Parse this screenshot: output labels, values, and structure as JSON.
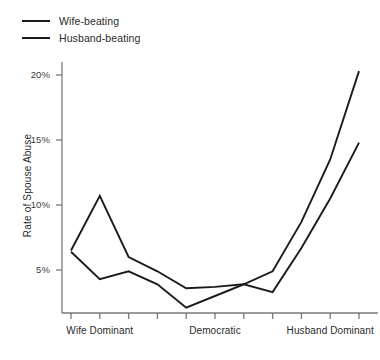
{
  "chart_data": {
    "type": "line",
    "title": "",
    "subtitle": "",
    "xlabel": "",
    "ylabel": "Rate of Spouse Abuse",
    "legend_position": "top-left",
    "grid": false,
    "x_axis": {
      "tick_count": 11,
      "labeled_ticks": [
        {
          "index": 1,
          "label": "Wife Dominant"
        },
        {
          "index": 5,
          "label": "Democratic"
        },
        {
          "index": 9,
          "label": "Husband Dominant"
        }
      ],
      "categories": [
        "",
        "Wife Dominant",
        "",
        "",
        "",
        "Democratic",
        "",
        "",
        "",
        "Husband Dominant",
        ""
      ]
    },
    "y_axis": {
      "ticks": [
        5,
        10,
        15,
        20
      ],
      "tick_labels": [
        "5%",
        "10%",
        "15%",
        "20%"
      ],
      "ylim": [
        0.3,
        21.0
      ],
      "unit": "%"
    },
    "series": [
      {
        "name": "Wife-beating",
        "color": "#1b1b1b",
        "values": [
          6.5,
          10.7,
          6.0,
          4.9,
          3.6,
          3.7,
          3.9,
          4.9,
          8.7,
          13.5,
          20.3
        ]
      },
      {
        "name": "Husband-beating",
        "color": "#1b1b1b",
        "values": [
          6.4,
          4.3,
          4.9,
          3.9,
          2.1,
          3.0,
          3.9,
          3.3,
          6.7,
          10.5,
          14.8
        ]
      }
    ]
  },
  "legend": {
    "items": [
      {
        "label": "Wife-beating"
      },
      {
        "label": "Husband-beating"
      }
    ]
  },
  "colors": {
    "line": "#1b1b1b",
    "axis": "#7a7a7a",
    "text": "#2a2a2a",
    "background": "#ffffff"
  }
}
